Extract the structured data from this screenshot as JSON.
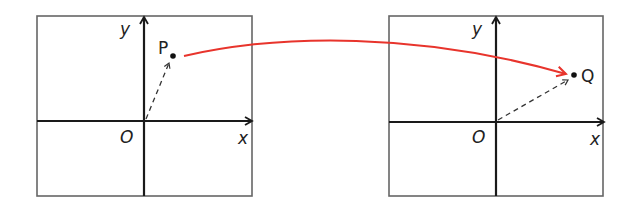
{
  "diagram": {
    "left_plane": {
      "x_axis_label": "x",
      "y_axis_label": "y",
      "origin_label": "O",
      "point_label": "P"
    },
    "right_plane": {
      "x_axis_label": "x",
      "y_axis_label": "y",
      "origin_label": "O",
      "point_label": "Q"
    },
    "mapping_arrow": {
      "from": "P",
      "to": "Q",
      "color": "#e8342c"
    },
    "colors": {
      "frame": "#555555",
      "axis": "#1a1a1a",
      "vector": "#333333",
      "mapping": "#e8342c"
    }
  }
}
